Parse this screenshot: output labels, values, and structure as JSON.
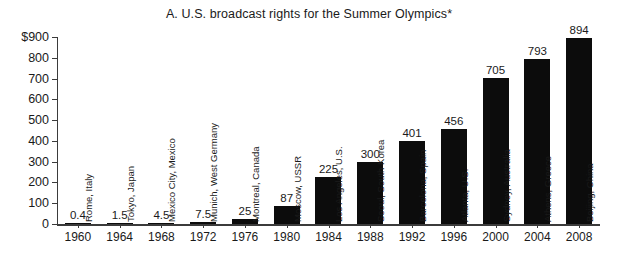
{
  "chart_data": {
    "type": "bar",
    "title": "A.  U.S. broadcast rights for the Summer Olympics*",
    "xlabel": "",
    "ylabel": "",
    "ylim": [
      0,
      900
    ],
    "ytick_labels": [
      "$900",
      "800",
      "700",
      "600",
      "500",
      "400",
      "300",
      "200",
      "100",
      "0"
    ],
    "ytick_values": [
      900,
      800,
      700,
      600,
      500,
      400,
      300,
      200,
      100,
      0
    ],
    "grid": false,
    "legend": "none",
    "categories": [
      "1960",
      "1964",
      "1968",
      "1972",
      "1976",
      "1980",
      "1984",
      "1988",
      "1992",
      "1996",
      "2000",
      "2004",
      "2008"
    ],
    "values": [
      0.4,
      1.5,
      4.5,
      7.5,
      25,
      87,
      225,
      300,
      401,
      456,
      705,
      793,
      894
    ],
    "value_labels": [
      "0.4",
      "1.5",
      "4.5",
      "7.5",
      "25",
      "87",
      "225",
      "300",
      "401",
      "456",
      "705",
      "793",
      "894"
    ],
    "point_labels": [
      "Rome, Italy",
      "Tokyo, Japan",
      "Mexico City, Mexico",
      "Munich, West Germany",
      "Montreal, Canada",
      "Moscow, USSR",
      "Los Angeles, U.S.",
      "Seoul, South Korea",
      "Barcelona, Spain",
      "Atlanta, U.S.",
      "Sydney, Australia",
      "Athens, Greece",
      "Beijing, China"
    ],
    "bar_color": "#0c0c0c",
    "axis_color": "#3b3b3b",
    "background": "#ffffff"
  }
}
